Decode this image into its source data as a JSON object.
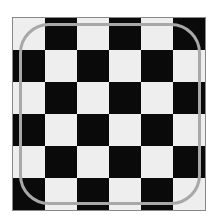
{
  "board": {
    "rows": 6,
    "cols": 6,
    "light_color": "#eeeeee",
    "dark_color": "#0a0a0a",
    "pattern": [
      [
        "light",
        "dark",
        "light",
        "dark",
        "light",
        "dark"
      ],
      [
        "dark",
        "light",
        "dark",
        "light",
        "dark",
        "light"
      ],
      [
        "light",
        "dark",
        "light",
        "dark",
        "light",
        "dark"
      ],
      [
        "dark",
        "light",
        "dark",
        "light",
        "dark",
        "light"
      ],
      [
        "light",
        "dark",
        "light",
        "dark",
        "light",
        "dark"
      ],
      [
        "dark",
        "light",
        "dark",
        "light",
        "dark",
        "light"
      ]
    ]
  },
  "outline": {
    "shape": "rounded-square",
    "color": "#a8a8a8"
  }
}
